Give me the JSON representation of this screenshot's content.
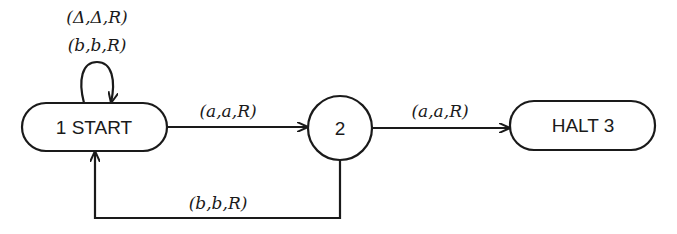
{
  "diagram": {
    "type": "turing-machine-state-diagram",
    "nodes": [
      {
        "id": "1",
        "label": "1 START",
        "shape": "rounded-rect"
      },
      {
        "id": "2",
        "label": "2",
        "shape": "circle"
      },
      {
        "id": "3",
        "label": "HALT 3",
        "shape": "rounded-rect"
      }
    ],
    "edges": [
      {
        "from": "1",
        "to": "1",
        "labels": [
          "(Δ,Δ,R)",
          "(b,b,R)"
        ]
      },
      {
        "from": "1",
        "to": "2",
        "label": "(a,a,R)"
      },
      {
        "from": "2",
        "to": "3",
        "label": "(a,a,R)"
      },
      {
        "from": "2",
        "to": "1",
        "label": "(b,b,R)"
      }
    ]
  }
}
